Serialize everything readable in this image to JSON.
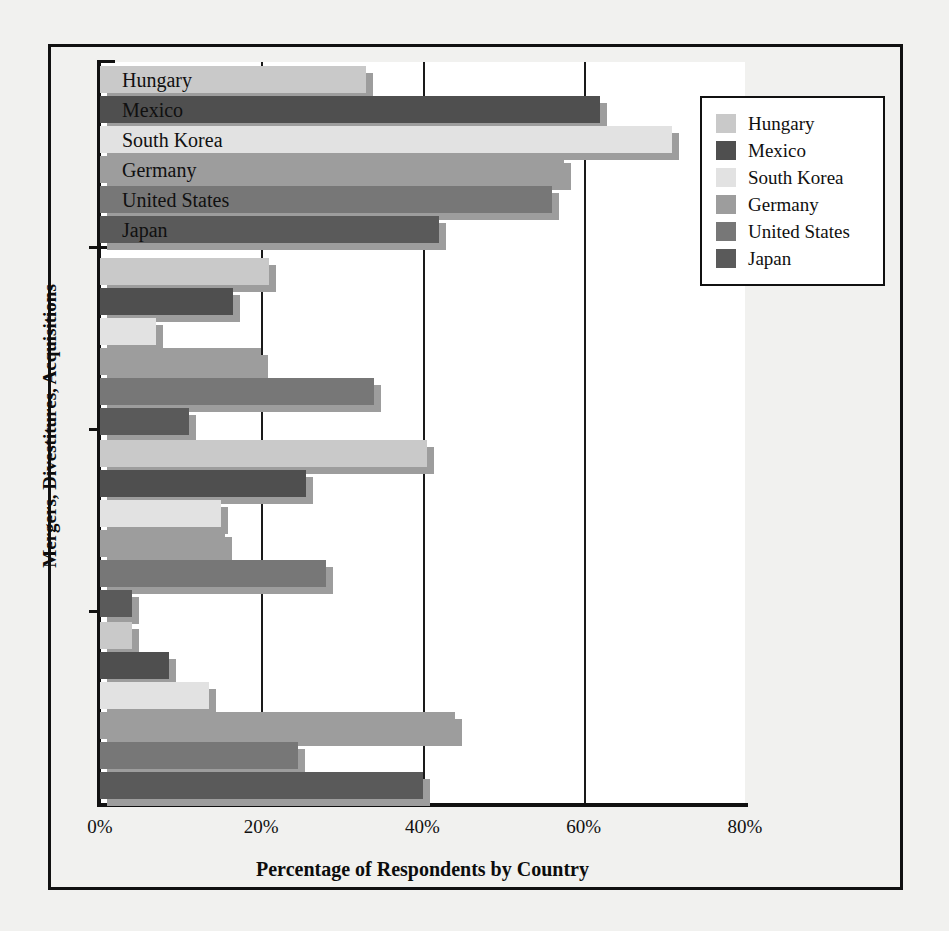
{
  "chart_data": {
    "type": "bar",
    "orientation": "horizontal",
    "title": "",
    "xlabel": "Percentage of Respondents by Country",
    "ylabel": "Mergers, Divestitures, Acquisitions",
    "xlim": [
      0,
      80
    ],
    "xticks": [
      "0%",
      "20%",
      "40%",
      "60%",
      "80%"
    ],
    "xtick_values": [
      0,
      20,
      40,
      60,
      80
    ],
    "grid": "vertical gridlines at 20%, 40%, 60%",
    "legend_position": "top-right inside plot",
    "categories": [
      "group-1",
      "group-2",
      "group-3",
      "group-4"
    ],
    "category_labels": [
      "",
      "",
      "",
      ""
    ],
    "series": [
      {
        "name": "Hungary",
        "color": "#c9c9c9",
        "values": [
          33,
          21,
          40.5,
          4
        ]
      },
      {
        "name": "Mexico",
        "color": "#4f4f4f",
        "values": [
          62,
          16.5,
          25.5,
          8.5
        ]
      },
      {
        "name": "South Korea",
        "color": "#e2e2e2",
        "values": [
          71,
          7,
          15,
          13.5
        ]
      },
      {
        "name": "Germany",
        "color": "#9d9d9d",
        "values": [
          57.5,
          20,
          15.5,
          44
        ]
      },
      {
        "name": "United States",
        "color": "#777777",
        "values": [
          56,
          34,
          28,
          24.5
        ]
      },
      {
        "name": "Japan",
        "color": "#5a5a5a",
        "values": [
          42,
          11,
          4,
          40
        ]
      }
    ]
  },
  "legend": {
    "items": [
      {
        "label": "Hungary",
        "color": "#c9c9c9"
      },
      {
        "label": "Mexico",
        "color": "#4f4f4f"
      },
      {
        "label": "South Korea",
        "color": "#e2e2e2"
      },
      {
        "label": "Germany",
        "color": "#9d9d9d"
      },
      {
        "label": "United States",
        "color": "#777777"
      },
      {
        "label": "Japan",
        "color": "#5a5a5a"
      }
    ]
  },
  "inbar_labels": [
    "Hungary",
    "Mexico",
    "South Korea",
    "Germany",
    "United States",
    "Japan"
  ],
  "axis": {
    "x_title": "Percentage of Respondents by Country",
    "y_title": "Mergers, Divestitures, Acquisitions",
    "x_tick_labels": [
      "0%",
      "20%",
      "40%",
      "60%",
      "80%"
    ]
  }
}
